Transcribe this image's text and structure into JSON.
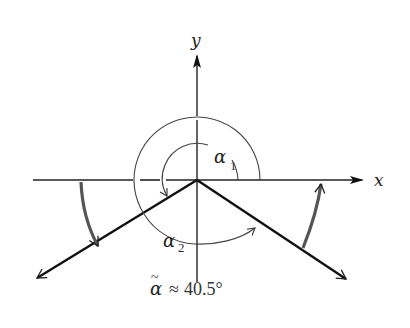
{
  "diagram": {
    "axes": {
      "x_label": "x",
      "y_label": "y"
    },
    "angles": {
      "alpha1_label": "α",
      "alpha1_subscript": "1",
      "alpha2_label": "α",
      "alpha2_subscript": "2"
    },
    "caption": {
      "symbol": "α̃",
      "approx": "≈",
      "value": "40.5°"
    },
    "colors": {
      "line": "#111111",
      "thin_arc": "#444444",
      "thick_arc": "#555555",
      "background": "#ffffff"
    }
  }
}
